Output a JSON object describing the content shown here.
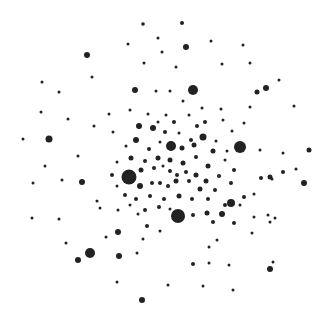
{
  "canvas": {
    "width": 333,
    "height": 314,
    "background": "#ffffff",
    "dot_color": "#222222"
  },
  "dots": [
    [
      143,
      24,
      1.8
    ],
    [
      182,
      23,
      2
    ],
    [
      87,
      55,
      3
    ],
    [
      186,
      47,
      3
    ],
    [
      158,
      38,
      1.5
    ],
    [
      128,
      44,
      1.5
    ],
    [
      211,
      41,
      1.5
    ],
    [
      243,
      45,
      1.5
    ],
    [
      162,
      52,
      1.5
    ],
    [
      176,
      67,
      1.5
    ],
    [
      144,
      63,
      1.5
    ],
    [
      193,
      90,
      5
    ],
    [
      222,
      64,
      1.5
    ],
    [
      250,
      63,
      1.5
    ],
    [
      279,
      80,
      1.5
    ],
    [
      266,
      88,
      3
    ],
    [
      257,
      92,
      2.5
    ],
    [
      135,
      90,
      3
    ],
    [
      92,
      77,
      1.5
    ],
    [
      59,
      92,
      1.5
    ],
    [
      42,
      82,
      1.5
    ],
    [
      41,
      112,
      1.5
    ],
    [
      68,
      119,
      1.5
    ],
    [
      49,
      139,
      3.5
    ],
    [
      23,
      139,
      1.5
    ],
    [
      94,
      126,
      1.5
    ],
    [
      109,
      114,
      1.5
    ],
    [
      130,
      110,
      1.5
    ],
    [
      156,
      91,
      1.5
    ],
    [
      170,
      91,
      1.5
    ],
    [
      202,
      108,
      1.5
    ],
    [
      250,
      107,
      1.5
    ],
    [
      294,
      106,
      1.5
    ],
    [
      189,
      115,
      1.5
    ],
    [
      221,
      109,
      1.5
    ],
    [
      183,
      101,
      1.5
    ],
    [
      148,
      114,
      1.5
    ],
    [
      113,
      132,
      1.5
    ],
    [
      139,
      126,
      3
    ],
    [
      153,
      128,
      3
    ],
    [
      166,
      115,
      1.5
    ],
    [
      174,
      122,
      2
    ],
    [
      197,
      126,
      2
    ],
    [
      203,
      137,
      3.5
    ],
    [
      194,
      145,
      2.5
    ],
    [
      179,
      133,
      1.5
    ],
    [
      171,
      146,
      5
    ],
    [
      182,
      148,
      2.5
    ],
    [
      160,
      142,
      1.5
    ],
    [
      149,
      149,
      2
    ],
    [
      136,
      140,
      3
    ],
    [
      126,
      146,
      1.5
    ],
    [
      216,
      141,
      1.5
    ],
    [
      232,
      131,
      1.5
    ],
    [
      240,
      147,
      6
    ],
    [
      227,
      151,
      1.5
    ],
    [
      213,
      151,
      2.5
    ],
    [
      196,
      157,
      2
    ],
    [
      208,
      166,
      2.5
    ],
    [
      183,
      163,
      2.5
    ],
    [
      170,
      160,
      2.5
    ],
    [
      158,
      158,
      2.5
    ],
    [
      145,
      161,
      2
    ],
    [
      131,
      158,
      2.5
    ],
    [
      117,
      162,
      1.5
    ],
    [
      112,
      175,
      2
    ],
    [
      131,
      173,
      2.5
    ],
    [
      141,
      170,
      2.5
    ],
    [
      154,
      168,
      2
    ],
    [
      163,
      166,
      1.5
    ],
    [
      170,
      171,
      2
    ],
    [
      177,
      175,
      2
    ],
    [
      186,
      172,
      2
    ],
    [
      196,
      175,
      2.5
    ],
    [
      206,
      181,
      2.5
    ],
    [
      219,
      176,
      2
    ],
    [
      234,
      170,
      2
    ],
    [
      129,
      177,
      7.5
    ],
    [
      140,
      186,
      3
    ],
    [
      152,
      183,
      2
    ],
    [
      160,
      183,
      2
    ],
    [
      168,
      186,
      2
    ],
    [
      176,
      181,
      2.5
    ],
    [
      189,
      181,
      2
    ],
    [
      200,
      189,
      2.5
    ],
    [
      215,
      190,
      2
    ],
    [
      231,
      183,
      2
    ],
    [
      240,
      205,
      1.5
    ],
    [
      244,
      197,
      2
    ],
    [
      261,
      178,
      2
    ],
    [
      272,
      179,
      1.5
    ],
    [
      283,
      172,
      2
    ],
    [
      296,
      169,
      1.5
    ],
    [
      309,
      150,
      2.5
    ],
    [
      304,
      183,
      3
    ],
    [
      270,
      177,
      2.5
    ],
    [
      283,
      153,
      1.5
    ],
    [
      117,
      186,
      1.5
    ],
    [
      125,
      195,
      2
    ],
    [
      136,
      199,
      2
    ],
    [
      150,
      196,
      2
    ],
    [
      164,
      199,
      2
    ],
    [
      179,
      196,
      2.5
    ],
    [
      192,
      199,
      2
    ],
    [
      208,
      199,
      2
    ],
    [
      225,
      205,
      2
    ],
    [
      231,
      203,
      4
    ],
    [
      254,
      194,
      1.5
    ],
    [
      130,
      205,
      1.5
    ],
    [
      145,
      210,
      2
    ],
    [
      159,
      207,
      2
    ],
    [
      170,
      209,
      1.5
    ],
    [
      178,
      216,
      7
    ],
    [
      193,
      215,
      2
    ],
    [
      207,
      213,
      2.5
    ],
    [
      213,
      222,
      2
    ],
    [
      222,
      214,
      3
    ],
    [
      234,
      223,
      2
    ],
    [
      254,
      217,
      1.5
    ],
    [
      268,
      215,
      1.5
    ],
    [
      270,
      222,
      1.5
    ],
    [
      275,
      218,
      1.5
    ],
    [
      97,
      201,
      1.5
    ],
    [
      82,
      182,
      3
    ],
    [
      62,
      180,
      1.5
    ],
    [
      100,
      208,
      1.5
    ],
    [
      118,
      210,
      1.5
    ],
    [
      138,
      214,
      1.5
    ],
    [
      147,
      226,
      2
    ],
    [
      160,
      231,
      1.5
    ],
    [
      118,
      232,
      3
    ],
    [
      59,
      219,
      1.5
    ],
    [
      32,
      218,
      1.5
    ],
    [
      66,
      243,
      1.5
    ],
    [
      90,
      253,
      5
    ],
    [
      78,
      260,
      3
    ],
    [
      119,
      256,
      3
    ],
    [
      137,
      253,
      1.5
    ],
    [
      143,
      239,
      1.5
    ],
    [
      209,
      247,
      1.5
    ],
    [
      217,
      240,
      1.5
    ],
    [
      252,
      233,
      1.5
    ],
    [
      193,
      264,
      2
    ],
    [
      209,
      263,
      1.5
    ],
    [
      229,
      265,
      1.5
    ],
    [
      270,
      269,
      3
    ],
    [
      273,
      262,
      1.5
    ],
    [
      117,
      282,
      1.5
    ],
    [
      168,
      285,
      1.5
    ],
    [
      203,
      286,
      1.5
    ],
    [
      233,
      290,
      1.5
    ],
    [
      142,
      300,
      3
    ],
    [
      78,
      156,
      1.5
    ],
    [
      45,
      166,
      1.5
    ],
    [
      33,
      183,
      1.5
    ],
    [
      106,
      237,
      1.5
    ],
    [
      191,
      140,
      2
    ],
    [
      205,
      122,
      2
    ],
    [
      165,
      132,
      2
    ],
    [
      158,
      122,
      1.5
    ],
    [
      223,
      120,
      1.5
    ],
    [
      244,
      123,
      1.5
    ],
    [
      225,
      160,
      1.5
    ],
    [
      260,
      150,
      1.5
    ]
  ]
}
